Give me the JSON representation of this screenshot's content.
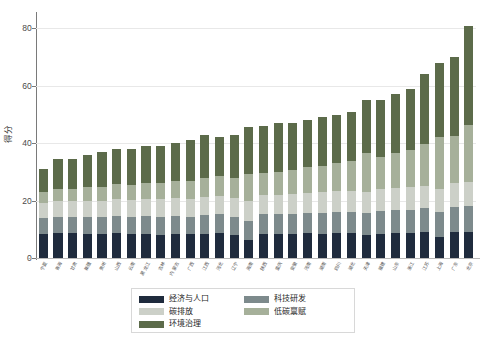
{
  "chart_data": {
    "type": "bar",
    "stacked": true,
    "title": "",
    "xlabel": "",
    "ylabel": "得分",
    "ylim": [
      0,
      85
    ],
    "yticks": [
      0,
      20,
      40,
      60,
      80
    ],
    "grid": true,
    "legend_position": "bottom-center",
    "categories": [
      "宁夏",
      "青海",
      "甘肃",
      "新疆",
      "贵州",
      "山西",
      "云南",
      "黑龙江",
      "吉林",
      "内蒙古",
      "广西",
      "江西",
      "河北",
      "辽宁",
      "海南",
      "陕西",
      "重庆",
      "安徽",
      "河南",
      "湖南",
      "四川",
      "湖北",
      "天津",
      "福建",
      "山东",
      "浙江",
      "江苏",
      "上海",
      "广东",
      "北京"
    ],
    "series": [
      {
        "name": "经济与人口",
        "color": "#1f2b3d",
        "values": [
          8.5,
          8.8,
          8.6,
          8.2,
          8.4,
          8.6,
          8.2,
          8.4,
          8.0,
          8.3,
          8.2,
          8.5,
          8.6,
          8.0,
          6.4,
          8.4,
          8.3,
          8.4,
          8.6,
          8.5,
          8.7,
          8.6,
          8.0,
          8.5,
          8.8,
          8.6,
          8.9,
          7.4,
          9.0,
          9.0
        ]
      },
      {
        "name": "科技研发",
        "color": "#7d8a8c",
        "values": [
          5.4,
          5.6,
          5.8,
          6.0,
          5.8,
          6.2,
          6.0,
          6.1,
          6.3,
          6.4,
          6.2,
          6.5,
          6.6,
          6.4,
          6.6,
          6.8,
          6.9,
          7.0,
          7.1,
          7.2,
          7.4,
          7.5,
          7.6,
          7.8,
          8.0,
          8.2,
          8.4,
          8.6,
          8.8,
          9.0
        ]
      },
      {
        "name": "碳排放",
        "color": "#ccd0c8",
        "values": [
          5.1,
          5.3,
          5.4,
          5.6,
          5.6,
          5.8,
          5.9,
          6.0,
          6.1,
          6.2,
          6.2,
          6.4,
          6.5,
          6.6,
          6.7,
          6.8,
          6.9,
          7.0,
          7.1,
          7.2,
          7.3,
          7.4,
          7.5,
          7.6,
          7.7,
          7.8,
          7.9,
          8.0,
          8.2,
          8.4
        ]
      },
      {
        "name": "低碳禀赋",
        "color": "#a6b09a",
        "values": [
          4.0,
          4.2,
          4.4,
          4.8,
          5.0,
          5.2,
          5.4,
          5.6,
          5.8,
          6.0,
          6.2,
          6.5,
          6.8,
          7.0,
          9.5,
          7.6,
          8.0,
          8.4,
          8.8,
          9.2,
          9.6,
          10.2,
          13.5,
          11.2,
          12.0,
          13.0,
          14.5,
          18.0,
          16.5,
          20.0
        ]
      },
      {
        "name": "环境治理",
        "color": "#5c6b4a",
        "values": [
          8.0,
          10.6,
          10.3,
          11.4,
          12.2,
          12.2,
          12.5,
          12.9,
          12.8,
          13.1,
          14.2,
          15.1,
          13.5,
          15.0,
          16.3,
          16.4,
          16.9,
          16.2,
          16.4,
          16.9,
          17.0,
          17.3,
          18.4,
          19.9,
          20.5,
          21.4,
          24.3,
          26.0,
          27.5,
          34.6
        ]
      }
    ]
  },
  "legend": {
    "items": [
      {
        "label": "经济与人口",
        "color": "#1f2b3d"
      },
      {
        "label": "科技研发",
        "color": "#7d8a8c"
      },
      {
        "label": "碳排放",
        "color": "#ccd0c8"
      },
      {
        "label": "低碳禀赋",
        "color": "#a6b09a"
      },
      {
        "label": "环境治理",
        "color": "#5c6b4a"
      }
    ]
  }
}
